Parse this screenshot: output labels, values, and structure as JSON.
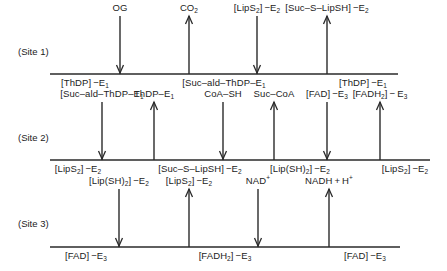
{
  "colors": {
    "line": "#2a2a2a",
    "text": "#222222",
    "background": "#ffffff"
  },
  "rows": [
    {
      "site_label": "(Site 1)",
      "line_y": 74,
      "x_start": 50,
      "x_end": 398,
      "label_y": 64,
      "arrows": [
        {
          "x": 120,
          "dir": "down",
          "label": "OG"
        },
        {
          "x": 189,
          "dir": "up",
          "label": "CO2"
        },
        {
          "x": 257,
          "dir": "down",
          "label": "[LipS2]-E2"
        },
        {
          "x": 327,
          "dir": "up",
          "label": "[Suc-S-LipSH]-E2"
        }
      ],
      "states": [
        {
          "x": 85,
          "label": "[ThDP]-E1"
        },
        {
          "x": 224,
          "label": "[Suc-ald-ThDP-E1"
        },
        {
          "x": 363,
          "label": "[ThDP]-E1"
        }
      ]
    },
    {
      "site_label": "(Site 2)",
      "line_y": 160,
      "x_start": 50,
      "x_end": 430,
      "arrows": [
        {
          "x": 102,
          "dir": "down",
          "label": "[Suc-ald-ThDP-E1"
        },
        {
          "x": 154,
          "dir": "up",
          "label": "ThDP-E1"
        },
        {
          "x": 223,
          "dir": "down",
          "label": "CoA-SH"
        },
        {
          "x": 274,
          "dir": "up",
          "label": "Suc-CoA"
        },
        {
          "x": 327,
          "dir": "down",
          "label": "[FAD]-E3"
        },
        {
          "x": 380,
          "dir": "up",
          "label": "[FADH2]-E3"
        }
      ],
      "states": [
        {
          "x": 78,
          "label": "[LipS2]-E2"
        },
        {
          "x": 200,
          "label": "[Suc-S-LipSH]-E2"
        },
        {
          "x": 300,
          "label": "[Lip(SH)2]-E2"
        },
        {
          "x": 405,
          "label": "[LipS2]-E2"
        }
      ]
    },
    {
      "site_label": "(Site 3)",
      "line_y": 247,
      "x_start": 50,
      "x_end": 400,
      "arrows": [
        {
          "x": 119,
          "dir": "down",
          "label": "[Lip(SH)2]-E2"
        },
        {
          "x": 189,
          "dir": "up",
          "label": "[LipS2]-E2"
        },
        {
          "x": 258,
          "dir": "down",
          "label": "NAD+"
        },
        {
          "x": 329,
          "dir": "up",
          "label": "NADH+H+"
        }
      ],
      "states": [
        {
          "x": 86,
          "label": "[FAD]-E3"
        },
        {
          "x": 225,
          "label": "[FADH2]-E3"
        },
        {
          "x": 365,
          "label": "[FAD]-E3"
        }
      ]
    }
  ],
  "labels_html": {
    "r1": {
      "site": "(Site 1)",
      "a": [
        "OG",
        "CO<sub>2</sub>",
        "[LipS<sub>2</sub>]&thinsp;&minus;E<sub>2</sub>",
        "[Suc&ndash;S&ndash;LipSH]&thinsp;&minus;E<sub>2</sub>"
      ],
      "s": [
        "[ThDP]&thinsp;&minus;E<sub>1</sub>",
        "[Suc&ndash;ald&ndash;ThDP&ndash;E<sub>1</sub>",
        "[ThDP]&thinsp;&minus;E<sub>1</sub>"
      ]
    },
    "r2": {
      "site": "(Site 2)",
      "a": [
        "[Suc&ndash;ald&ndash;ThDP&ndash;E<sub>1</sub>",
        "ThDP&ndash;E<sub>1</sub>",
        "CoA&ndash;SH",
        "Suc&ndash;CoA",
        "[FAD]&thinsp;&minus;E<sub>3</sub>",
        "[FADH<sub>2</sub>]&thinsp;&minus;&thinsp;E<sub>3</sub>"
      ],
      "s": [
        "[LipS<sub>2</sub>]&thinsp;&minus;E<sub>2</sub>",
        "[Suc&ndash;S&ndash;LipSH]&thinsp;&minus;E<sub>2</sub>",
        "[Lip(SH)<sub>2</sub>]&thinsp;&minus;E<sub>2</sub>",
        "[LipS<sub>2</sub>]&thinsp;&minus;E<sub>2</sub>"
      ]
    },
    "r3": {
      "site": "(Site 3)",
      "a": [
        "[Lip(SH)<sub>2</sub>]&thinsp;&minus;E<sub>2</sub>",
        "[LipS<sub>2</sub>]&thinsp;&minus;E<sub>2</sub>",
        "NAD<sup>+</sup>",
        "NADH&thinsp;+&thinsp;H<sup>+</sup>"
      ],
      "s": [
        "[FAD]&thinsp;&minus;E<sub>3</sub>",
        "[FADH<sub>2</sub>]&thinsp;&minus;E<sub>3</sub>",
        "[FAD]&thinsp;&minus;E<sub>3</sub>"
      ]
    }
  }
}
